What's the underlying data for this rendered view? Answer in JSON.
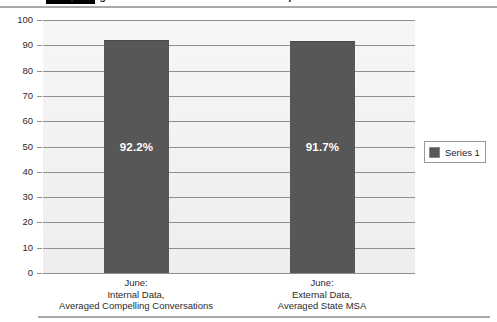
{
  "title_strip": {
    "clipped_title": "Compelling Conversations vs. State MSA Comparison",
    "highlight_color": "#000000",
    "rule_color": "#a8a8a8"
  },
  "chart_data": {
    "type": "bar",
    "title": "",
    "xlabel": "",
    "ylabel": "",
    "ylim": [
      0,
      100
    ],
    "ytick_step": 10,
    "grid": true,
    "legend_position": "right",
    "categories": [
      "June:\nInternal Data,\nAveraged Compelling Conversations",
      "June:\nExternal Data,\nAveraged State MSA"
    ],
    "category_lines": [
      [
        "June:",
        "Internal Data,",
        "Averaged Compelling Conversations"
      ],
      [
        "June:",
        "External Data,",
        "Averaged State MSA"
      ]
    ],
    "values": [
      92.2,
      91.7
    ],
    "data_labels": [
      "92.2%",
      "91.7%"
    ],
    "series": [
      {
        "name": "Series 1",
        "color": "#575757",
        "values": [
          92.2,
          91.7
        ]
      }
    ],
    "ytick_labels": [
      "100",
      "90",
      "80",
      "70",
      "60",
      "50",
      "40",
      "30",
      "20",
      "10",
      "0"
    ],
    "plot_background": "#f1f1f1",
    "gridline_color": "#8f8f8f"
  },
  "legend": {
    "entries": [
      {
        "label": "Series 1",
        "color": "#575757"
      }
    ]
  }
}
